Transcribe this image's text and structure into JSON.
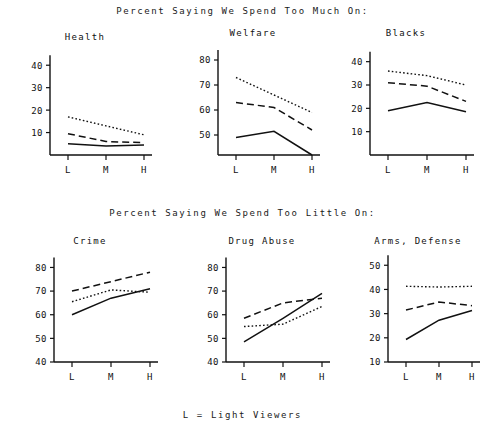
{
  "headings": {
    "top": "Percent Saying We Spend Too Much On:",
    "bottom": "Percent Saying We Spend Too Little On:",
    "footnote": "L = Light Viewers"
  },
  "categories": [
    "L",
    "M",
    "H"
  ],
  "chart_data": [
    {
      "type": "line",
      "title": "Health",
      "xlabel": "",
      "ylabel": "",
      "categories": [
        "L",
        "M",
        "H"
      ],
      "yticks": [
        10,
        20,
        30,
        40
      ],
      "ylim": [
        0,
        45
      ],
      "grid": false,
      "legend": "none",
      "series": [
        {
          "name": "dotted",
          "style": "dotted",
          "values": [
            17,
            13,
            9
          ]
        },
        {
          "name": "dashed",
          "style": "dashed",
          "values": [
            9.5,
            6,
            5.5
          ]
        },
        {
          "name": "solid",
          "style": "solid",
          "values": [
            5,
            4,
            4.5
          ]
        }
      ]
    },
    {
      "type": "line",
      "title": "Welfare",
      "xlabel": "",
      "ylabel": "",
      "categories": [
        "L",
        "M",
        "H"
      ],
      "yticks": [
        50,
        60,
        70,
        80
      ],
      "ylim": [
        42,
        84
      ],
      "grid": false,
      "legend": "none",
      "series": [
        {
          "name": "dotted",
          "style": "dotted",
          "values": [
            73,
            66,
            59
          ]
        },
        {
          "name": "dashed",
          "style": "dashed",
          "values": [
            63,
            61,
            52
          ]
        },
        {
          "name": "solid",
          "style": "solid",
          "values": [
            49,
            51.5,
            42
          ]
        }
      ]
    },
    {
      "type": "line",
      "title": "Blacks",
      "xlabel": "",
      "ylabel": "",
      "categories": [
        "L",
        "M",
        "H"
      ],
      "yticks": [
        10,
        20,
        30,
        40
      ],
      "ylim": [
        0,
        45
      ],
      "grid": false,
      "legend": "none",
      "series": [
        {
          "name": "dotted",
          "style": "dotted",
          "values": [
            36,
            34,
            30
          ]
        },
        {
          "name": "dashed",
          "style": "dashed",
          "values": [
            31,
            29.5,
            23
          ]
        },
        {
          "name": "solid",
          "style": "solid",
          "values": [
            19,
            22.5,
            18.5
          ]
        }
      ]
    },
    {
      "type": "line",
      "title": "Crime",
      "xlabel": "",
      "ylabel": "",
      "categories": [
        "L",
        "M",
        "H"
      ],
      "yticks": [
        40,
        50,
        60,
        70,
        80
      ],
      "ylim": [
        40,
        84
      ],
      "grid": false,
      "legend": "none",
      "series": [
        {
          "name": "dashed",
          "style": "dashed",
          "values": [
            70,
            74,
            78
          ]
        },
        {
          "name": "dotted",
          "style": "dotted",
          "values": [
            65.5,
            70.5,
            69.5
          ]
        },
        {
          "name": "solid",
          "style": "solid",
          "values": [
            60,
            67,
            71
          ]
        }
      ]
    },
    {
      "type": "line",
      "title": "Drug Abuse",
      "xlabel": "",
      "ylabel": "",
      "categories": [
        "L",
        "M",
        "H"
      ],
      "yticks": [
        40,
        50,
        60,
        70,
        80
      ],
      "ylim": [
        40,
        84
      ],
      "grid": false,
      "legend": "none",
      "series": [
        {
          "name": "dashed",
          "style": "dashed",
          "values": [
            58.5,
            65,
            67
          ]
        },
        {
          "name": "dotted",
          "style": "dotted",
          "values": [
            55,
            56,
            63.5
          ]
        },
        {
          "name": "solid",
          "style": "solid",
          "values": [
            48.5,
            58.5,
            69
          ]
        }
      ]
    },
    {
      "type": "line",
      "title": "Arms, Defense",
      "xlabel": "",
      "ylabel": "",
      "categories": [
        "L",
        "M",
        "H"
      ],
      "yticks": [
        10,
        20,
        30,
        40,
        50
      ],
      "ylim": [
        10,
        53
      ],
      "grid": false,
      "legend": "none",
      "series": [
        {
          "name": "dotted",
          "style": "dotted",
          "values": [
            41.3,
            41,
            41.3
          ]
        },
        {
          "name": "dashed",
          "style": "dashed",
          "values": [
            31.5,
            34.8,
            33.3
          ]
        },
        {
          "name": "solid",
          "style": "solid",
          "values": [
            19.3,
            27.3,
            31.3
          ]
        }
      ]
    }
  ]
}
